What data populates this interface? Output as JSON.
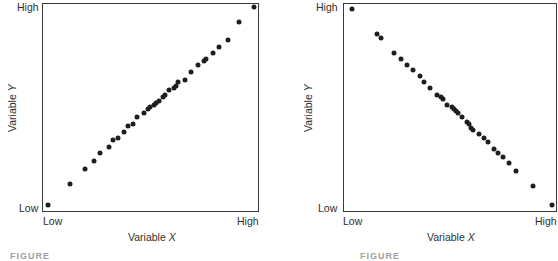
{
  "chart_data": [
    {
      "type": "scatter",
      "title": "",
      "xlabel": "Variable X",
      "ylabel": "Variable Y",
      "x_ticks": [
        "Low",
        "High"
      ],
      "y_ticks": [
        "Low",
        "High"
      ],
      "xlim": [
        0,
        1
      ],
      "ylim": [
        0,
        1
      ],
      "grid": false,
      "relationship": "perfect positive correlation",
      "points": [
        [
          0.03,
          0.03
        ],
        [
          0.13,
          0.13
        ],
        [
          0.2,
          0.2
        ],
        [
          0.24,
          0.24
        ],
        [
          0.27,
          0.28
        ],
        [
          0.31,
          0.31
        ],
        [
          0.33,
          0.34
        ],
        [
          0.35,
          0.35
        ],
        [
          0.38,
          0.38
        ],
        [
          0.4,
          0.41
        ],
        [
          0.42,
          0.42
        ],
        [
          0.44,
          0.45
        ],
        [
          0.47,
          0.47
        ],
        [
          0.49,
          0.49
        ],
        [
          0.5,
          0.5
        ],
        [
          0.52,
          0.51
        ],
        [
          0.53,
          0.52
        ],
        [
          0.54,
          0.53
        ],
        [
          0.56,
          0.55
        ],
        [
          0.57,
          0.56
        ],
        [
          0.59,
          0.58
        ],
        [
          0.61,
          0.59
        ],
        [
          0.62,
          0.6
        ],
        [
          0.63,
          0.62
        ],
        [
          0.66,
          0.63
        ],
        [
          0.69,
          0.67
        ],
        [
          0.72,
          0.7
        ],
        [
          0.75,
          0.72
        ],
        [
          0.76,
          0.73
        ],
        [
          0.79,
          0.76
        ],
        [
          0.82,
          0.79
        ],
        [
          0.86,
          0.82
        ],
        [
          0.91,
          0.91
        ],
        [
          0.98,
          0.98
        ]
      ]
    },
    {
      "type": "scatter",
      "title": "",
      "xlabel": "Variable X",
      "ylabel": "Variable Y",
      "x_ticks": [
        "Low",
        "High"
      ],
      "y_ticks": [
        "Low",
        "High"
      ],
      "xlim": [
        0,
        1
      ],
      "ylim": [
        0,
        1
      ],
      "grid": false,
      "relationship": "perfect negative correlation",
      "points": [
        [
          0.04,
          0.97
        ],
        [
          0.16,
          0.85
        ],
        [
          0.18,
          0.83
        ],
        [
          0.24,
          0.76
        ],
        [
          0.27,
          0.73
        ],
        [
          0.3,
          0.7
        ],
        [
          0.33,
          0.68
        ],
        [
          0.36,
          0.65
        ],
        [
          0.38,
          0.62
        ],
        [
          0.41,
          0.59
        ],
        [
          0.44,
          0.56
        ],
        [
          0.46,
          0.55
        ],
        [
          0.47,
          0.54
        ],
        [
          0.49,
          0.51
        ],
        [
          0.51,
          0.5
        ],
        [
          0.52,
          0.49
        ],
        [
          0.53,
          0.48
        ],
        [
          0.54,
          0.47
        ],
        [
          0.56,
          0.45
        ],
        [
          0.58,
          0.43
        ],
        [
          0.59,
          0.42
        ],
        [
          0.6,
          0.4
        ],
        [
          0.61,
          0.39
        ],
        [
          0.64,
          0.37
        ],
        [
          0.66,
          0.35
        ],
        [
          0.68,
          0.33
        ],
        [
          0.71,
          0.3
        ],
        [
          0.73,
          0.28
        ],
        [
          0.75,
          0.26
        ],
        [
          0.78,
          0.23
        ],
        [
          0.81,
          0.19
        ],
        [
          0.89,
          0.12
        ],
        [
          0.98,
          0.03
        ]
      ]
    }
  ],
  "panels": [
    {
      "x_low": "Low",
      "x_high": "High",
      "y_low": "Low",
      "y_high": "High",
      "xlabel_prefix": "Variable ",
      "xlabel_var": "X",
      "ylabel_prefix": "Variable ",
      "ylabel_var": "Y",
      "caption": "FIGURE"
    },
    {
      "x_low": "Low",
      "x_high": "High",
      "y_low": "Low",
      "y_high": "High",
      "xlabel_prefix": "Variable ",
      "xlabel_var": "X",
      "ylabel_prefix": "Variable ",
      "ylabel_var": "Y",
      "caption": "FIGURE"
    }
  ],
  "colors": {
    "dot": "#1e1e1e",
    "frame": "#3a3a3a",
    "text": "#2e2e2e"
  }
}
